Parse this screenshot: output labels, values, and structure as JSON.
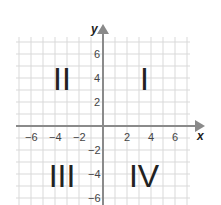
{
  "diagram": {
    "type": "coordinate-plane",
    "origin_px": [
      103,
      126
    ],
    "unit_px": 12,
    "grid_range": {
      "x": [
        -7,
        7
      ],
      "y": [
        -7,
        7
      ]
    },
    "axes": {
      "x": {
        "label": "x",
        "ticks": [
          -6,
          -4,
          -2,
          2,
          4,
          6
        ]
      },
      "y": {
        "label": "y",
        "ticks": [
          6,
          4,
          2,
          -2,
          -4,
          -6
        ]
      }
    },
    "tick_labels": {
      "x_neg6": "−6",
      "x_neg4": "−4",
      "x_neg2": "−2",
      "x_2": "2",
      "x_4": "4",
      "x_6": "6",
      "y_6": "6",
      "y_4": "4",
      "y_2": "2",
      "y_neg2": "−2",
      "y_neg4": "−4",
      "y_neg6": "−6"
    },
    "quadrants": {
      "q1": "I",
      "q2": "II",
      "q3": "III",
      "q4": "IV"
    },
    "colors": {
      "grid": "#d9d9d9",
      "axis": "#8a8a8a",
      "text": "#222222"
    }
  }
}
